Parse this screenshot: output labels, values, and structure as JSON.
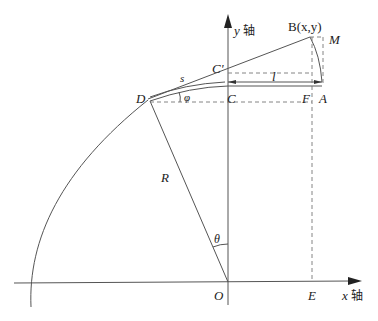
{
  "diagram": {
    "axes": {
      "y_label_var": "y",
      "y_label_text": "轴",
      "x_label_var": "x",
      "x_label_text": "轴"
    },
    "points": {
      "B": "B(x,y)",
      "M": "M",
      "C_prime": "C'",
      "C": "C",
      "D": "D",
      "F": "F",
      "A": "A",
      "O": "O",
      "E": "E"
    },
    "quantities": {
      "s": "s",
      "l": "l",
      "phi": "φ",
      "R": "R",
      "theta": "θ"
    },
    "colors": {
      "line": "#555555",
      "dashed": "#777777",
      "text": "#222222"
    }
  }
}
